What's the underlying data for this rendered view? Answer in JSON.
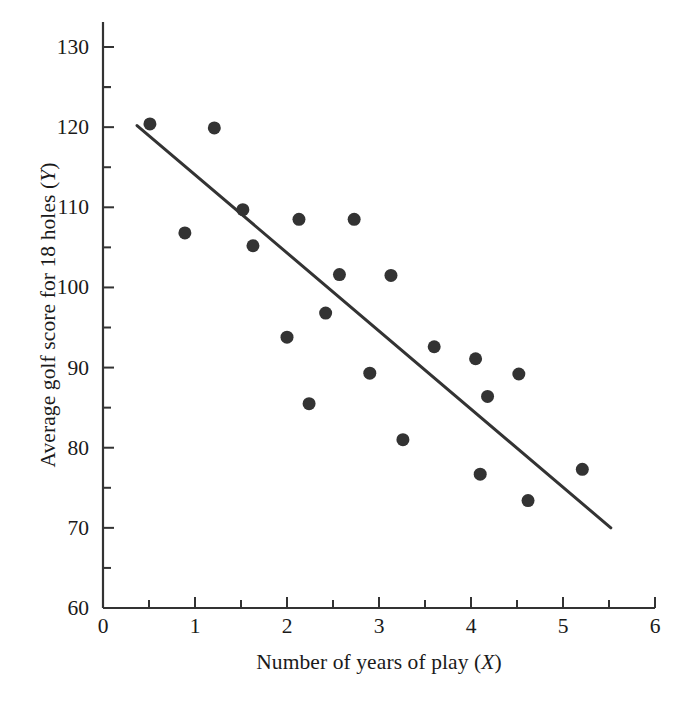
{
  "chart_data": {
    "type": "scatter",
    "title": "",
    "xlabel": "Number of years of play (X)",
    "ylabel": "Average golf score for 18 holes (Y)",
    "xlim": [
      0,
      6.4
    ],
    "ylim": [
      60,
      133
    ],
    "xticks": [
      0,
      1,
      2,
      3,
      4,
      5,
      6
    ],
    "xtick_labels": [
      "0",
      "1",
      "2",
      "3",
      "4",
      "5",
      "6"
    ],
    "xminor_step": 0.5,
    "yticks": [
      60,
      70,
      80,
      90,
      100,
      110,
      120,
      130
    ],
    "ytick_labels": [
      "60",
      "70",
      "80",
      "90",
      "100",
      "110",
      "120",
      "130"
    ],
    "yminor_step": 5,
    "grid": false,
    "legend": null,
    "marker": {
      "shape": "circle",
      "color": "#333333",
      "size_px": 13
    },
    "points": [
      {
        "x": 0.51,
        "y": 120.4
      },
      {
        "x": 0.89,
        "y": 106.8
      },
      {
        "x": 1.21,
        "y": 119.9
      },
      {
        "x": 1.52,
        "y": 109.7
      },
      {
        "x": 1.63,
        "y": 105.2
      },
      {
        "x": 2.0,
        "y": 93.8
      },
      {
        "x": 2.13,
        "y": 108.5
      },
      {
        "x": 2.24,
        "y": 85.5
      },
      {
        "x": 2.42,
        "y": 96.8
      },
      {
        "x": 2.57,
        "y": 101.6
      },
      {
        "x": 2.73,
        "y": 108.5
      },
      {
        "x": 2.9,
        "y": 89.3
      },
      {
        "x": 3.13,
        "y": 101.5
      },
      {
        "x": 3.26,
        "y": 81.0
      },
      {
        "x": 3.6,
        "y": 92.6
      },
      {
        "x": 4.05,
        "y": 91.1
      },
      {
        "x": 4.1,
        "y": 76.7
      },
      {
        "x": 4.18,
        "y": 86.4
      },
      {
        "x": 4.52,
        "y": 89.2
      },
      {
        "x": 4.62,
        "y": 73.4
      },
      {
        "x": 5.21,
        "y": 77.3
      }
    ],
    "fit_line": {
      "type": "linear-regression",
      "x_start": 0.37,
      "y_start": 120.2,
      "x_end": 5.52,
      "y_end": 70.0,
      "color": "#333333",
      "width_px": 3
    }
  },
  "axis": {
    "x_axis_name": "x-axis",
    "y_axis_name": "y-axis",
    "axis_color": "#333333"
  }
}
